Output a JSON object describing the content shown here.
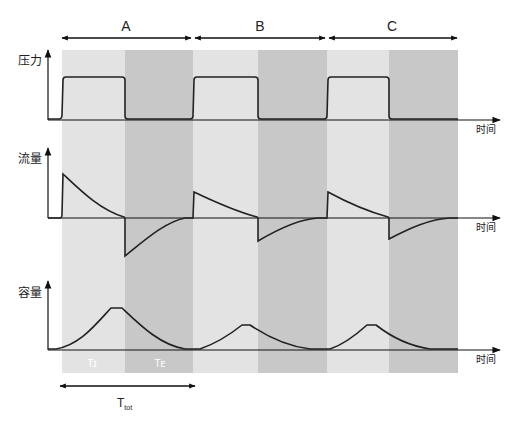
{
  "diagram": {
    "type": "ventilator waveform diagram",
    "cycles": [
      {
        "label": "A",
        "x1": 62,
        "x2": 193
      },
      {
        "label": "B",
        "x1": 193,
        "x2": 327
      },
      {
        "label": "C",
        "x1": 327,
        "x2": 458
      }
    ],
    "phase_labels": {
      "inspiration": "Tɪ",
      "expiration": "Tᴇ"
    },
    "total_time": {
      "main": "T",
      "sub": "tot"
    },
    "panels": [
      {
        "id": "pressure",
        "ylabel": "压力",
        "xlabel": "时间"
      },
      {
        "id": "flow",
        "ylabel": "流量",
        "xlabel": "时间"
      },
      {
        "id": "volume",
        "ylabel": "容量",
        "xlabel": "时间"
      }
    ],
    "colors": {
      "light_band": "#e3e3e3",
      "dark_band": "#c8c8c8",
      "line": "#222222",
      "axis": "#111111",
      "phase_label": "#ffffff"
    }
  }
}
